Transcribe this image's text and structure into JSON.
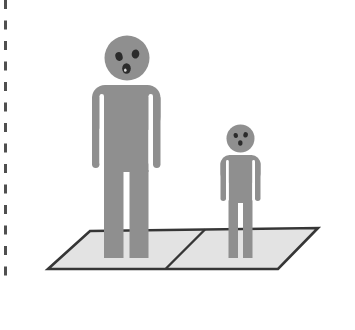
{
  "scene": {
    "description": "Illustration of two gray person pictograms with startled faces, a large one and a small one, standing on a light-gray parallelogram floor split into two tiles; vertical dashed page-edge line along the left side",
    "background_color": "#ffffff",
    "colors": {
      "figure": "#8f8f8f",
      "face": "#2b2b2b",
      "mouth_highlight": "#d9d9d9",
      "floor_fill": "#e3e3e3",
      "floor_outline": "#363636",
      "dashed_edge": "#4f4f4f",
      "gap": "#ffffff"
    },
    "elements": {
      "dashed_edge_line": "vertical-dashed-border",
      "floor": "two-tile-parallelogram-floor",
      "large_person": "large-person-pictogram-left-tile",
      "small_person": "small-person-pictogram-right-tile"
    }
  }
}
